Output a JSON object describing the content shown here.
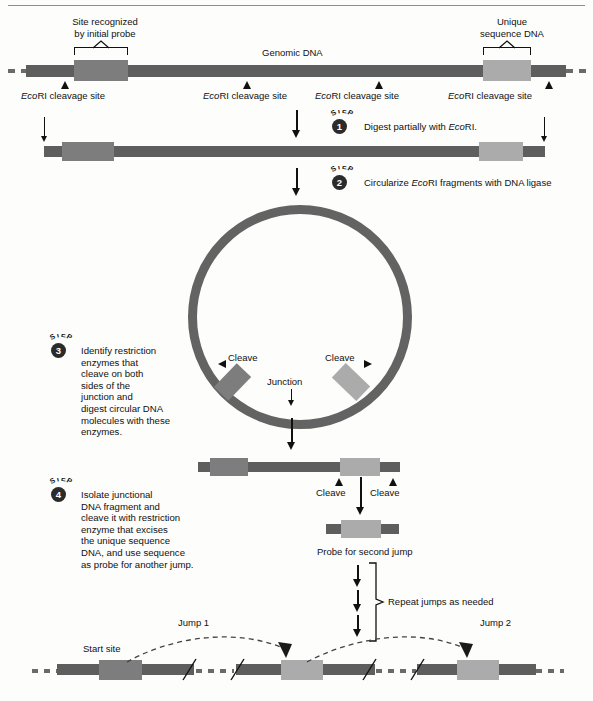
{
  "figure": {
    "title_present": false,
    "colors": {
      "dna_dark": "#5e5e5e",
      "dna_mid": "#7d7d7d",
      "dna_light": "#ababab",
      "ring": "#636363",
      "ink": "#111111",
      "rule": "#8d8d8d",
      "page_bg": "#fdfdfb"
    }
  },
  "top_panel": {
    "site_label_line1": "Site recognized",
    "site_label_line2": "by initial probe",
    "genomic_label": "Genomic DNA",
    "unique_label_line1": "Unique",
    "unique_label_line2": "sequence DNA",
    "cleavage_sites": [
      {
        "prefix": "Eco",
        "rest": "RI cleavage site"
      },
      {
        "prefix": "Eco",
        "rest": "RI cleavage site"
      },
      {
        "prefix": "Eco",
        "rest": "RI cleavage site"
      },
      {
        "prefix": "Eco",
        "rest": "RI cleavage site"
      }
    ]
  },
  "steps": [
    {
      "num": "1",
      "word": "STEP",
      "text_prefix": "Digest partially with ",
      "text_italic": "Eco",
      "text_suffix": "RI."
    },
    {
      "num": "2",
      "word": "STEP",
      "text_prefix": "Circularize ",
      "text_italic": "Eco",
      "text_suffix": "RI fragments with DNA ligase"
    },
    {
      "num": "3",
      "word": "STEP",
      "lines": [
        "Identify restriction",
        "enzymes that",
        "cleave on both",
        "sides of the",
        "junction and",
        "digest circular DNA",
        "molecules with these",
        "enzymes."
      ]
    },
    {
      "num": "4",
      "word": "STEP",
      "lines": [
        "Isolate junctional",
        "DNA fragment and",
        "cleave it with restriction",
        "enzyme that excises",
        "the unique sequence",
        "DNA, and use sequence",
        "as probe for another jump."
      ]
    }
  ],
  "circle_panel": {
    "cleave_left": "Cleave",
    "cleave_right": "Cleave",
    "junction": "Junction"
  },
  "fragment_panel": {
    "cleave_left": "Cleave",
    "cleave_right": "Cleave",
    "probe_caption": "Probe for second jump"
  },
  "repeat_panel": {
    "label": "Repeat jumps as needed",
    "arrow_count": 3
  },
  "bottom_panel": {
    "start_site": "Start site",
    "jump1": "Jump 1",
    "jump2": "Jump 2"
  }
}
